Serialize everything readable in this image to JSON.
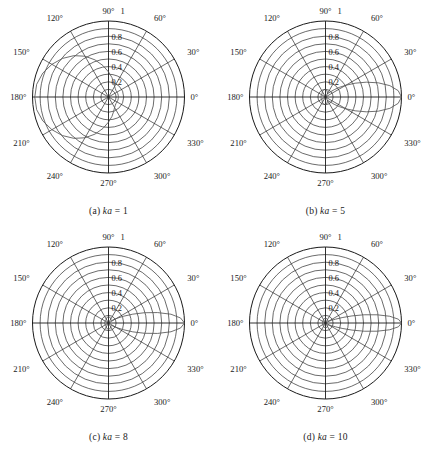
{
  "figure": {
    "kind": "polar-directivity-grid",
    "rows": 2,
    "cols": 2,
    "background": "#ffffff",
    "grid_color": "#2b2b2b",
    "curve_color": "#555555"
  },
  "chart_data": [
    {
      "type": "line",
      "subplot": "a",
      "title": "(a) ka = 1",
      "caption_prefix": "(a)",
      "caption_symbol": "ka",
      "caption_value": "= 1",
      "polar": true,
      "theta_unit": "degrees",
      "angle_ticks": [
        "0°",
        "30°",
        "60°",
        "90°",
        "120°",
        "150°",
        "180°",
        "210°",
        "240°",
        "270°",
        "300°",
        "330°"
      ],
      "angle_tick_values": [
        0,
        30,
        60,
        90,
        120,
        150,
        180,
        210,
        240,
        270,
        300,
        330
      ],
      "radial_ticks": [
        "0.2",
        "0.4",
        "0.6",
        "0.8",
        "1"
      ],
      "radial_tick_values": [
        0.2,
        0.4,
        0.6,
        0.8,
        1
      ],
      "rlim": [
        0,
        1
      ],
      "n_grid_circles": 10,
      "n_grid_spokes": 12,
      "grid": true,
      "legend": "none",
      "xlabel": "",
      "ylabel": "",
      "series": [
        {
          "name": "ka = 1",
          "theta": [
            0,
            10,
            20,
            30,
            40,
            50,
            60,
            70,
            80,
            90,
            100,
            110,
            120,
            130,
            140,
            150,
            160,
            170,
            180,
            190,
            200,
            210,
            220,
            230,
            240,
            250,
            260,
            270,
            280,
            290,
            300,
            310,
            320,
            330,
            340,
            350,
            360
          ],
          "r": [
            0.13,
            0.13,
            0.13,
            0.13,
            0.13,
            0.14,
            0.16,
            0.2,
            0.26,
            0.33,
            0.42,
            0.52,
            0.62,
            0.71,
            0.79,
            0.86,
            0.92,
            0.96,
            0.97,
            0.96,
            0.92,
            0.86,
            0.79,
            0.71,
            0.62,
            0.52,
            0.42,
            0.33,
            0.26,
            0.2,
            0.16,
            0.14,
            0.13,
            0.13,
            0.13,
            0.13,
            0.13
          ]
        }
      ]
    },
    {
      "type": "line",
      "subplot": "b",
      "title": "(b) ka = 5",
      "caption_prefix": "(b)",
      "caption_symbol": "ka",
      "caption_value": "= 5",
      "polar": true,
      "theta_unit": "degrees",
      "angle_ticks": [
        "0°",
        "30°",
        "60°",
        "90°",
        "120°",
        "150°",
        "180°",
        "210°",
        "240°",
        "270°",
        "300°",
        "330°"
      ],
      "angle_tick_values": [
        0,
        30,
        60,
        90,
        120,
        150,
        180,
        210,
        240,
        270,
        300,
        330
      ],
      "radial_ticks": [
        "0.2",
        "0.4",
        "0.6",
        "0.8",
        "1"
      ],
      "radial_tick_values": [
        0.2,
        0.4,
        0.6,
        0.8,
        1
      ],
      "rlim": [
        0,
        1
      ],
      "n_grid_circles": 10,
      "n_grid_spokes": 12,
      "grid": true,
      "legend": "none",
      "xlabel": "",
      "ylabel": "",
      "series": [
        {
          "name": "ka = 5",
          "theta": [
            0,
            5,
            10,
            15,
            20,
            25,
            30,
            35,
            40,
            45,
            50,
            60,
            70,
            80,
            90,
            100,
            110,
            120,
            130,
            140,
            150,
            160,
            170,
            180,
            190,
            200,
            210,
            220,
            230,
            240,
            250,
            260,
            270,
            280,
            290,
            300,
            310,
            320,
            325,
            330,
            335,
            340,
            345,
            350,
            355,
            360
          ],
          "r": [
            1.0,
            0.96,
            0.86,
            0.72,
            0.57,
            0.43,
            0.31,
            0.22,
            0.15,
            0.1,
            0.07,
            0.05,
            0.07,
            0.09,
            0.1,
            0.1,
            0.09,
            0.08,
            0.07,
            0.06,
            0.06,
            0.06,
            0.06,
            0.06,
            0.06,
            0.06,
            0.06,
            0.06,
            0.07,
            0.08,
            0.09,
            0.1,
            0.1,
            0.09,
            0.07,
            0.05,
            0.07,
            0.15,
            0.22,
            0.31,
            0.43,
            0.57,
            0.72,
            0.86,
            0.96,
            1.0
          ]
        }
      ]
    },
    {
      "type": "line",
      "subplot": "c",
      "title": "(c) ka = 8",
      "caption_prefix": "(c)",
      "caption_symbol": "ka",
      "caption_value": "= 8",
      "polar": true,
      "theta_unit": "degrees",
      "angle_ticks": [
        "0°",
        "30°",
        "60°",
        "90°",
        "120°",
        "150°",
        "180°",
        "210°",
        "240°",
        "270°",
        "300°",
        "330°"
      ],
      "angle_tick_values": [
        0,
        30,
        60,
        90,
        120,
        150,
        180,
        210,
        240,
        270,
        300,
        330
      ],
      "radial_ticks": [
        "0.2",
        "0.4",
        "0.6",
        "0.8",
        "1"
      ],
      "radial_tick_values": [
        0.2,
        0.4,
        0.6,
        0.8,
        1
      ],
      "rlim": [
        0,
        1
      ],
      "n_grid_circles": 10,
      "n_grid_spokes": 12,
      "grid": true,
      "legend": "none",
      "xlabel": "",
      "ylabel": "",
      "series": [
        {
          "name": "ka = 8",
          "theta": [
            0,
            4,
            8,
            12,
            16,
            20,
            24,
            28,
            32,
            36,
            40,
            50,
            60,
            70,
            80,
            90,
            100,
            110,
            120,
            130,
            140,
            150,
            160,
            170,
            180,
            190,
            200,
            210,
            220,
            230,
            240,
            250,
            260,
            270,
            280,
            290,
            300,
            310,
            320,
            324,
            328,
            332,
            336,
            340,
            344,
            348,
            352,
            356,
            360
          ],
          "r": [
            1.0,
            0.95,
            0.83,
            0.66,
            0.49,
            0.34,
            0.22,
            0.14,
            0.09,
            0.06,
            0.05,
            0.05,
            0.06,
            0.07,
            0.08,
            0.08,
            0.08,
            0.07,
            0.06,
            0.05,
            0.05,
            0.05,
            0.05,
            0.05,
            0.05,
            0.05,
            0.05,
            0.05,
            0.05,
            0.05,
            0.06,
            0.07,
            0.08,
            0.08,
            0.08,
            0.07,
            0.06,
            0.05,
            0.05,
            0.06,
            0.09,
            0.14,
            0.22,
            0.34,
            0.49,
            0.66,
            0.83,
            0.95,
            1.0
          ]
        }
      ]
    },
    {
      "type": "line",
      "subplot": "d",
      "title": "(d) ka = 10",
      "caption_prefix": "(d)",
      "caption_symbol": "ka",
      "caption_value": "= 10",
      "polar": true,
      "theta_unit": "degrees",
      "angle_ticks": [
        "0°",
        "30°",
        "60°",
        "90°",
        "120°",
        "150°",
        "180°",
        "210°",
        "240°",
        "270°",
        "300°",
        "330°"
      ],
      "angle_tick_values": [
        0,
        30,
        60,
        90,
        120,
        150,
        180,
        210,
        240,
        270,
        300,
        330
      ],
      "radial_ticks": [
        "0.2",
        "0.4",
        "0.6",
        "0.8",
        "1"
      ],
      "radial_tick_values": [
        0.2,
        0.4,
        0.6,
        0.8,
        1
      ],
      "rlim": [
        0,
        1
      ],
      "n_grid_circles": 10,
      "n_grid_spokes": 12,
      "grid": true,
      "legend": "none",
      "xlabel": "",
      "ylabel": "",
      "series": [
        {
          "name": "ka = 10",
          "theta": [
            0,
            3,
            6,
            9,
            12,
            15,
            18,
            21,
            24,
            27,
            30,
            40,
            50,
            60,
            70,
            80,
            90,
            100,
            110,
            120,
            130,
            140,
            150,
            160,
            170,
            180,
            190,
            200,
            210,
            220,
            230,
            240,
            250,
            260,
            270,
            280,
            290,
            300,
            310,
            320,
            330,
            333,
            336,
            339,
            342,
            345,
            348,
            351,
            354,
            357,
            360
          ],
          "r": [
            1.0,
            0.96,
            0.85,
            0.69,
            0.52,
            0.36,
            0.23,
            0.14,
            0.09,
            0.06,
            0.04,
            0.04,
            0.05,
            0.05,
            0.06,
            0.06,
            0.06,
            0.06,
            0.06,
            0.05,
            0.05,
            0.04,
            0.04,
            0.04,
            0.04,
            0.04,
            0.04,
            0.04,
            0.04,
            0.04,
            0.05,
            0.05,
            0.06,
            0.06,
            0.06,
            0.06,
            0.06,
            0.05,
            0.05,
            0.04,
            0.04,
            0.06,
            0.09,
            0.14,
            0.23,
            0.36,
            0.52,
            0.69,
            0.85,
            0.96,
            1.0
          ]
        }
      ]
    }
  ]
}
